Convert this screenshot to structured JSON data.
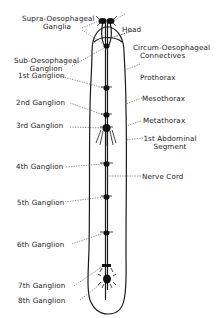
{
  "diagram": {
    "colors": {
      "ink": "#1a1a1a",
      "background": "#ffffff"
    },
    "left_labels": [
      {
        "id": "supra",
        "line1": "Supra-Oesophageal",
        "line2": "Ganglia"
      },
      {
        "id": "sub",
        "line1": "Sub-Oesophageal",
        "line2": "Ganglion"
      },
      {
        "id": "g1",
        "line1": "1st Ganglion"
      },
      {
        "id": "g2",
        "line1": "2nd Ganglion"
      },
      {
        "id": "g3",
        "line1": "3rd Ganglion"
      },
      {
        "id": "g4",
        "line1": "4th Ganglion"
      },
      {
        "id": "g5",
        "line1": "5th Ganglion"
      },
      {
        "id": "g6",
        "line1": "6th Ganglion"
      },
      {
        "id": "g7",
        "line1": "7th Ganglion"
      },
      {
        "id": "g8",
        "line1": "8th Ganglion"
      }
    ],
    "right_labels": [
      {
        "id": "head",
        "line1": "Head"
      },
      {
        "id": "circum",
        "line1": "Circum-Oesophageal",
        "line2": "Connectives"
      },
      {
        "id": "prothorax",
        "line1": "Prothorax"
      },
      {
        "id": "mesothorax",
        "line1": "Mesothorax"
      },
      {
        "id": "metathorax",
        "line1": "Metathorax"
      },
      {
        "id": "abd1",
        "line1": "1st Abdominal",
        "line2": "Segment"
      },
      {
        "id": "nervecord",
        "line1": "Nerve Cord"
      }
    ]
  }
}
